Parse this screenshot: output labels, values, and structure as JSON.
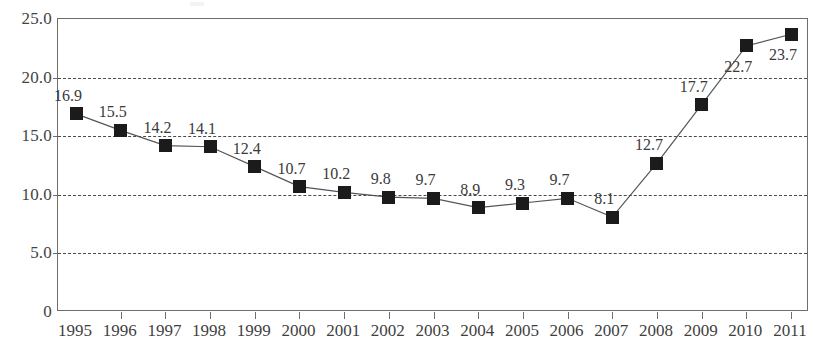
{
  "chart_data": {
    "type": "line",
    "title": "",
    "subtitle": "",
    "xlabel": "",
    "ylabel": "",
    "categories": [
      "1995",
      "1996",
      "1997",
      "1998",
      "1999",
      "2000",
      "2001",
      "2002",
      "2003",
      "2004",
      "2005",
      "2006",
      "2007",
      "2008",
      "2009",
      "2010",
      "2011"
    ],
    "values": [
      16.9,
      15.5,
      14.2,
      14.1,
      12.4,
      10.7,
      10.2,
      9.8,
      9.7,
      8.9,
      9.3,
      9.7,
      8.1,
      12.7,
      17.7,
      22.7,
      23.7
    ],
    "data_labels": [
      "16.9",
      "15.5",
      "14.2",
      "14.1",
      "12.4",
      "10.7",
      "10.2",
      "9.8",
      "9.7",
      "8.9",
      "9.3",
      "9.7",
      "8.1",
      "12.7",
      "17.7",
      "22.7",
      "23.7"
    ],
    "label_positions": [
      "above-left",
      "above-left",
      "above-left",
      "above-left",
      "above-left",
      "above-left",
      "above-left",
      "above-left",
      "above-left",
      "above-left",
      "above-left",
      "above-left",
      "above-left",
      "above-left",
      "above-left",
      "below-left",
      "below-left"
    ],
    "ylim": [
      0,
      25
    ],
    "yticks": [
      0,
      5,
      10,
      15,
      20,
      25
    ],
    "ytick_labels": [
      "0",
      "5.0",
      "10.0",
      "15.0",
      "20.0",
      "25.0"
    ],
    "grid": "horizontal-dashed",
    "gridline_values": [
      5,
      10,
      15,
      20
    ],
    "legend": "none",
    "marker": "filled-square",
    "line_color": "#555555",
    "marker_color": "#1b1b1b",
    "axis_color": "#6e6e6e",
    "grid_color": "#4a4a4a",
    "background_color": "#ffffff"
  }
}
